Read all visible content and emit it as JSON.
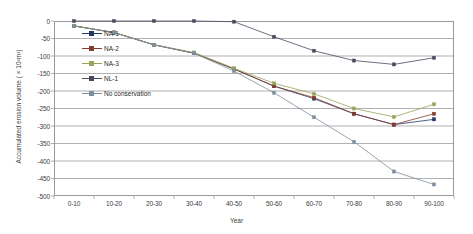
{
  "chart_data": {
    "type": "line",
    "title": "",
    "xlabel": "Year",
    "ylabel": "Accumulated erosion volume ( × 10³m³)",
    "categories": [
      "0-10",
      "10-20",
      "20-30",
      "30-40",
      "40-50",
      "50-60",
      "60-70",
      "70-80",
      "80-90",
      "90-100"
    ],
    "ylim": [
      0,
      -500
    ],
    "yticks": [
      "0",
      "-50",
      "-100",
      "-150",
      "-200",
      "-250",
      "-300",
      "-350",
      "-400",
      "-450",
      "-500"
    ],
    "ytick_values": [
      0,
      -50,
      -100,
      -150,
      -200,
      -250,
      -300,
      -350,
      -400,
      -450,
      -500
    ],
    "grid": true,
    "legend_position": "inside-top-left",
    "series": [
      {
        "name": "NA-1",
        "color": "#1f3864",
        "marker": "square",
        "values": [
          -14,
          -33,
          -68,
          -92,
          -137,
          -186,
          -222,
          -265,
          -296,
          -281
        ]
      },
      {
        "name": "NA-2",
        "color": "#843c2c",
        "marker": "square",
        "values": [
          -14,
          -33,
          -68,
          -92,
          -137,
          -186,
          -219,
          -265,
          -296,
          -265
        ]
      },
      {
        "name": "NA-3",
        "color": "#9aa55c",
        "marker": "square",
        "values": [
          -14,
          -33,
          -68,
          -90,
          -135,
          -178,
          -208,
          -250,
          -274,
          -238
        ]
      },
      {
        "name": "NL-1",
        "color": "#4a4a5e",
        "marker": "square",
        "values": [
          0,
          0,
          0,
          0,
          -2,
          -45,
          -85,
          -113,
          -124,
          -105
        ]
      },
      {
        "name": "No conservation",
        "color": "#7d8ea0",
        "marker": "square",
        "values": [
          -14,
          -33,
          -68,
          -92,
          -143,
          -205,
          -275,
          -345,
          -430,
          -467
        ]
      }
    ]
  }
}
